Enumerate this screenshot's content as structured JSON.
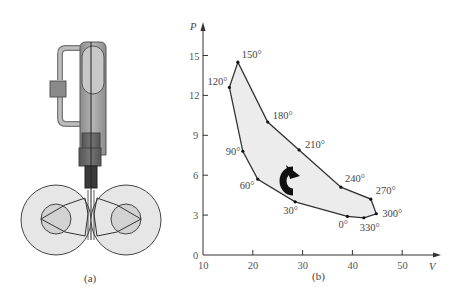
{
  "top_text": "",
  "panel_a": {
    "caption": "(a)"
  },
  "panel_b": {
    "caption": "(b)"
  },
  "chart_data": {
    "type": "line",
    "title": "",
    "xlabel": "V",
    "ylabel": "P",
    "xlim": [
      10,
      55
    ],
    "ylim": [
      0,
      17
    ],
    "x_ticks": [
      "10",
      "20",
      "30",
      "40",
      "50"
    ],
    "y_ticks": [
      "0",
      "3",
      "6",
      "9",
      "12",
      "15"
    ],
    "grid": false,
    "closed_loop": true,
    "fill": "#ececec",
    "direction": "clockwise",
    "points": [
      {
        "label": "0°",
        "V": 39.0,
        "P": 2.9
      },
      {
        "label": "30°",
        "V": 28.5,
        "P": 4.0
      },
      {
        "label": "60°",
        "V": 21.0,
        "P": 5.7
      },
      {
        "label": "90°",
        "V": 18.0,
        "P": 7.8
      },
      {
        "label": "120°",
        "V": 15.3,
        "P": 12.6
      },
      {
        "label": "150°",
        "V": 17.0,
        "P": 14.5
      },
      {
        "label": "180°",
        "V": 23.0,
        "P": 10.0
      },
      {
        "label": "210°",
        "V": 29.3,
        "P": 7.9
      },
      {
        "label": "240°",
        "V": 37.7,
        "P": 5.1
      },
      {
        "label": "270°",
        "V": 43.7,
        "P": 4.2
      },
      {
        "label": "300°",
        "V": 44.8,
        "P": 3.1
      },
      {
        "label": "330°",
        "V": 42.3,
        "P": 2.8
      }
    ]
  }
}
